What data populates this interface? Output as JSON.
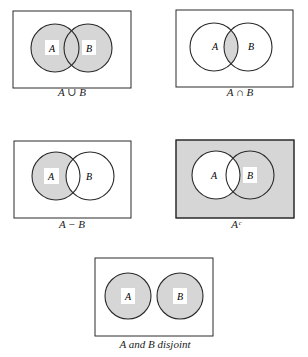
{
  "colors": {
    "shade": "#d6d6d6",
    "line": "#2a2a2a",
    "label_bg": "#ffffff"
  },
  "diagrams": [
    {
      "name": "union",
      "caption": "A ∪ B",
      "set_a_label": "A",
      "set_b_label": "B"
    },
    {
      "name": "intersection",
      "caption": "A ∩ B",
      "set_a_label": "A",
      "set_b_label": "B"
    },
    {
      "name": "difference",
      "caption": "A − B",
      "set_a_label": "A",
      "set_b_label": "B"
    },
    {
      "name": "complement",
      "caption": "Aᶜ",
      "set_a_label": "A",
      "set_b_label": "B"
    },
    {
      "name": "disjoint",
      "caption": "A and B disjoint",
      "set_a_label": "A",
      "set_b_label": "B"
    }
  ]
}
